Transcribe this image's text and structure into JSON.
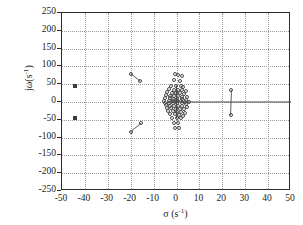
{
  "figure": {
    "background_color": "#ffffff",
    "frame_color": "#2b2b2b",
    "grid_color": "#9a9a9a",
    "marker_color": "#4a4a4a",
    "square_marker_color": "#3a3a3a"
  },
  "axes": {
    "xlabel": "σ (s",
    "xlabel_sup": "-1",
    "xlabel_tail": ")",
    "ylabel": "jω(s",
    "ylabel_sup": "-1",
    "ylabel_tail": ")",
    "xticks": [
      "-50",
      "-40",
      "-30",
      "-20",
      "-10",
      "0",
      "10",
      "20",
      "30",
      "40",
      "50"
    ],
    "yticks": [
      "250",
      "200",
      "150",
      "100",
      "50",
      "0",
      "-50",
      "-100",
      "-150",
      "-200",
      "-250"
    ]
  },
  "chart_data": {
    "type": "scatter",
    "title": "",
    "subtitle": "",
    "xlabel": "σ (s^-1)",
    "ylabel": "jω (s^-1)",
    "xlim": [
      -50,
      50
    ],
    "ylim": [
      -250,
      250
    ],
    "xtick_values": [
      -50,
      -40,
      -30,
      -20,
      -10,
      0,
      10,
      20,
      30,
      40,
      50
    ],
    "ytick_values": [
      250,
      200,
      150,
      100,
      50,
      0,
      -50,
      -100,
      -150,
      -200,
      -250
    ],
    "grid": true,
    "grid_style": "dotted",
    "legend": null,
    "legend_position": "none",
    "series": [
      {
        "name": "eigenvalues-open-circles",
        "marker": "open-circle",
        "points": [
          [
            -0.6,
            78
          ],
          [
            0.8,
            76
          ],
          [
            2.2,
            72
          ],
          [
            -1.0,
            62
          ],
          [
            1.4,
            60
          ],
          [
            -2.4,
            46
          ],
          [
            -0.4,
            45
          ],
          [
            1.8,
            44
          ],
          [
            3.0,
            41
          ],
          [
            -3.2,
            36
          ],
          [
            -1.2,
            35
          ],
          [
            0.6,
            34
          ],
          [
            2.4,
            33
          ],
          [
            4.0,
            30
          ],
          [
            -4.0,
            27
          ],
          [
            -2.0,
            26
          ],
          [
            -0.2,
            25
          ],
          [
            1.6,
            24
          ],
          [
            3.4,
            22
          ],
          [
            -4.6,
            19
          ],
          [
            -2.8,
            18
          ],
          [
            -1.0,
            17
          ],
          [
            0.8,
            16
          ],
          [
            2.6,
            15
          ],
          [
            4.4,
            14
          ],
          [
            -5.0,
            11
          ],
          [
            -3.0,
            10
          ],
          [
            -1.4,
            9
          ],
          [
            0.4,
            9
          ],
          [
            2.2,
            8
          ],
          [
            4.0,
            7
          ],
          [
            -5.4,
            4
          ],
          [
            -3.4,
            3
          ],
          [
            -1.6,
            3
          ],
          [
            0.2,
            2
          ],
          [
            2.0,
            2
          ],
          [
            3.8,
            1
          ],
          [
            5.4,
            1
          ],
          [
            -5.2,
            -2
          ],
          [
            -3.2,
            -3
          ],
          [
            -1.4,
            -3
          ],
          [
            0.4,
            -4
          ],
          [
            2.2,
            -4
          ],
          [
            4.2,
            -5
          ],
          [
            -4.8,
            -9
          ],
          [
            -2.8,
            -10
          ],
          [
            -1.0,
            -11
          ],
          [
            0.8,
            -11
          ],
          [
            2.6,
            -12
          ],
          [
            4.4,
            -13
          ],
          [
            -4.2,
            -17
          ],
          [
            -2.2,
            -18
          ],
          [
            -0.4,
            -19
          ],
          [
            1.4,
            -20
          ],
          [
            3.2,
            -21
          ],
          [
            -3.6,
            -25
          ],
          [
            -1.6,
            -26
          ],
          [
            0.2,
            -27
          ],
          [
            2.0,
            -28
          ],
          [
            3.6,
            -30
          ],
          [
            -2.8,
            -34
          ],
          [
            -0.8,
            -35
          ],
          [
            1.0,
            -36
          ],
          [
            2.8,
            -38
          ],
          [
            -1.8,
            -44
          ],
          [
            0.2,
            -45
          ],
          [
            2.0,
            -46
          ],
          [
            -1.2,
            -58
          ],
          [
            0.6,
            -60
          ],
          [
            -0.8,
            -72
          ],
          [
            1.0,
            -74
          ]
        ]
      },
      {
        "name": "fixed-poles-filled-squares",
        "marker": "filled-square",
        "points": [
          [
            -44.5,
            45
          ],
          [
            -44.5,
            -45
          ]
        ]
      },
      {
        "name": "migrating-pair-upper-left",
        "marker": "open-circle",
        "points": [
          [
            -20.0,
            80
          ],
          [
            -15.8,
            58
          ]
        ],
        "connected": true
      },
      {
        "name": "migrating-pair-lower-left",
        "marker": "open-circle",
        "points": [
          [
            -20.0,
            -83
          ],
          [
            -15.5,
            -60
          ]
        ],
        "connected": true
      },
      {
        "name": "migrating-pair-right",
        "marker": "open-circle",
        "points": [
          [
            24.0,
            33
          ],
          [
            23.6,
            -37
          ]
        ],
        "connected": true
      }
    ],
    "annotations": [
      {
        "name": "real-axis-locus-line",
        "type": "segment",
        "from": [
          -3.0,
          0
        ],
        "to": [
          50,
          0
        ]
      },
      {
        "name": "cluster-vertical-locus",
        "type": "segment",
        "from": [
          0.0,
          46
        ],
        "to": [
          0.0,
          -46
        ]
      }
    ]
  }
}
